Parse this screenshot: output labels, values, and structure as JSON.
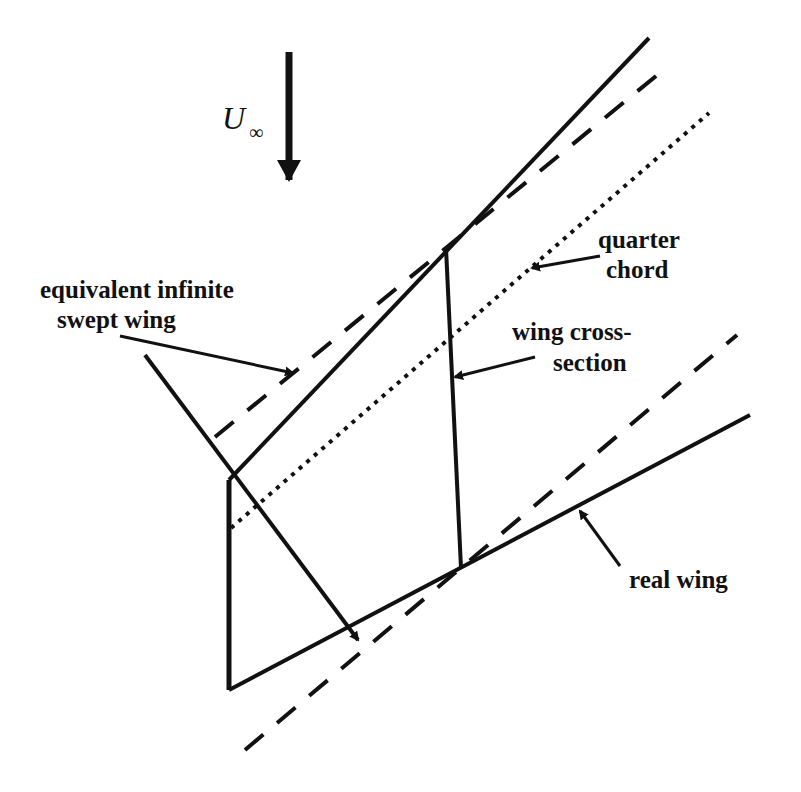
{
  "diagram": {
    "freestream": {
      "symbol": "U",
      "subscript": "∞",
      "direction": "down"
    },
    "labels": {
      "equivalent_line1": "equivalent infinite",
      "equivalent_line2": "swept wing",
      "quarter_line1": "quarter",
      "quarter_line2": "chord",
      "cross_line1": "wing cross-",
      "cross_line2": "section",
      "real": "real wing"
    },
    "line_styles": {
      "real_wing": "solid",
      "equivalent_infinite_swept_wing": "dashed",
      "quarter_chord": "dotted",
      "wing_cross_section": "solid"
    },
    "colors": {
      "ink": "#111111",
      "background": "#ffffff"
    }
  }
}
